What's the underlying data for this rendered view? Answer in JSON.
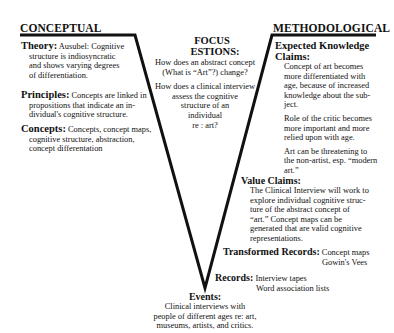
{
  "left": {
    "heading": "CONCEPTUAL",
    "theory": {
      "label": "Theory:",
      "text": "Ausubel: Cognitive",
      "lines": [
        "structure is indiosyncratic",
        "and shows varying degrees",
        "of differentiation."
      ]
    },
    "principles": {
      "label": "Principles:",
      "text": "Concepts are linked in",
      "lines": [
        "propositions that indicate an in-",
        "dividual's cognitive structure."
      ]
    },
    "concepts": {
      "label": "Concepts:",
      "text": "Concepts, concept maps,",
      "lines": [
        "cognitive structure, abstraction,",
        "concept differentation"
      ]
    }
  },
  "focus": {
    "heading1": "FOCUS",
    "heading2": "ESTIONS:",
    "q1": [
      "How does an abstract concept",
      "(What is “Art”?) change?"
    ],
    "q2": [
      "How does a clinical interview",
      "assess the cognitive",
      "structure of an",
      "individual",
      "re : art?"
    ]
  },
  "right": {
    "heading": "METHODOLOGICAL",
    "knowledge_claims": {
      "label1": "Expected Knowledge",
      "label2": "Claims:",
      "p1": [
        "Concept of art becomes",
        "more differentiated with",
        "age, because of increased",
        "knowledge about the sub-",
        "ject."
      ],
      "p2": [
        "Role of the critic becomes",
        "more important and more",
        "relied upon with age."
      ],
      "p3": [
        "Art can be threatening to",
        "the non-artist, esp. “modern",
        "art.”"
      ]
    },
    "value_claims": {
      "label": "Value Claims:",
      "lines": [
        "The Clinical Interview will work to",
        "explore individual cognitive struc-",
        "ture of the abstract concept of",
        "“art.” Concept maps can be",
        "generated that are valid cognitive",
        "representations."
      ]
    },
    "transformed_records": {
      "label": "Transformed Records:",
      "line1": "Concept maps",
      "line2": "Gowin's Vees"
    },
    "records": {
      "label": "Records:",
      "line1": "Interview tapes",
      "line2": "Word association lists"
    }
  },
  "events": {
    "label": "Events:",
    "lines": [
      "Clinical interviews with",
      "people of different ages re: art,",
      "museums, artists, and critics."
    ]
  },
  "colors": {
    "ink": "#111111",
    "background": "#ffffff"
  }
}
